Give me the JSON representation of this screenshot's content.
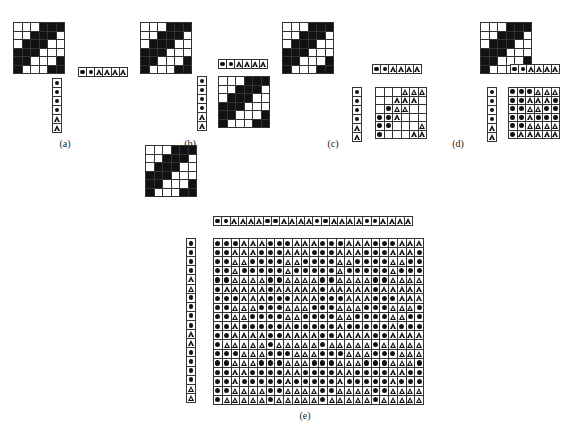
{
  "figure": {
    "colors": {
      "black": "#111111",
      "white": "#ffffff",
      "line": "#333333"
    },
    "symbols": {
      "D": "filled-circle",
      "T": "triangle"
    },
    "pattern": [
      "WWWBBB",
      "WWBBBW",
      "WBBBWW",
      "BBBWWW",
      "BBWWWB",
      "BWWWBB"
    ],
    "weft_row": [
      "D",
      "D",
      "T",
      "T",
      "T",
      "T"
    ],
    "warp_col": [
      "D",
      "D",
      "D",
      "D",
      "T",
      "T"
    ],
    "panels": [
      {
        "id": "a",
        "caption": "(a)"
      },
      {
        "id": "b",
        "caption": "(b)"
      },
      {
        "id": "c",
        "caption": "(c)"
      },
      {
        "id": "d",
        "caption": "(d)"
      },
      {
        "id": "e",
        "caption": "(e)"
      }
    ],
    "panel_e": {
      "cols": 24,
      "rows": 18
    }
  }
}
